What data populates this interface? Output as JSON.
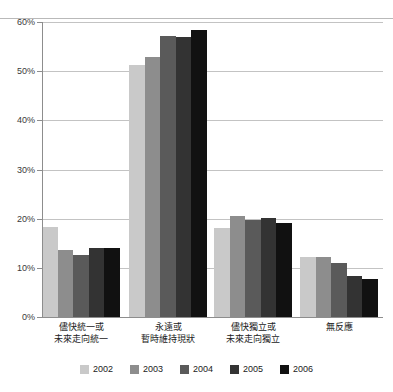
{
  "chart_data": {
    "type": "bar",
    "title": "",
    "subtitle": "",
    "xlabel": "",
    "ylabel": "",
    "ylim": [
      0,
      60
    ],
    "ytick_values": [
      0,
      10,
      20,
      30,
      40,
      50,
      60
    ],
    "ytick_labels": [
      "0%",
      "10%",
      "20%",
      "30%",
      "40%",
      "50%",
      "60%"
    ],
    "grid": true,
    "grid_axis": "y",
    "legend_position": "bottom",
    "categories": [
      "儘快統一或\n未來走向統一",
      "永遠或\n暫時維持現狀",
      "儘快獨立或\n未來走向獨立",
      "無反應"
    ],
    "categories_lines": [
      [
        "儘快統一或",
        "未來走向統一"
      ],
      [
        "永遠或",
        "暫時維持現狀"
      ],
      [
        "儘快獨立或",
        "未來走向獨立"
      ],
      [
        "無反應",
        ""
      ]
    ],
    "series": [
      {
        "name": "2002",
        "color": "#c9c9c9",
        "values": [
          18.3,
          51.2,
          18.1,
          12.3
        ]
      },
      {
        "name": "2003",
        "color": "#8d8d8d",
        "values": [
          13.7,
          52.8,
          20.5,
          12.3
        ]
      },
      {
        "name": "2004",
        "color": "#5a5a5a",
        "values": [
          12.7,
          57.2,
          19.7,
          11.0
        ]
      },
      {
        "name": "2005",
        "color": "#333333",
        "values": [
          14.0,
          56.9,
          20.1,
          8.3
        ]
      },
      {
        "name": "2006",
        "color": "#111111",
        "values": [
          14.0,
          58.3,
          19.2,
          7.7
        ]
      }
    ]
  }
}
